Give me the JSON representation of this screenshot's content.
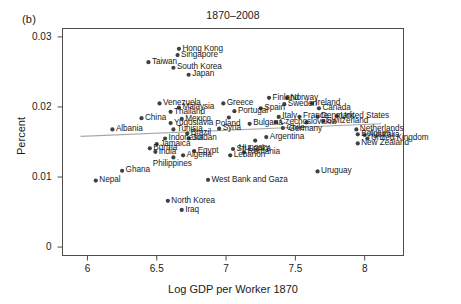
{
  "figure": {
    "panel_tag": "(b)",
    "title": "1870–2008"
  },
  "axes": {
    "xlabel": "Log GDP per Worker 1870",
    "ylabel": "Percent",
    "xticks": [
      "6",
      "6.5",
      "7",
      "7.5",
      "8"
    ],
    "yticks": [
      "0",
      "0.01",
      "0.02",
      "0.03"
    ]
  },
  "chart_data": {
    "type": "scatter",
    "title": "1870–2008",
    "xlabel": "Log GDP per Worker 1870",
    "ylabel": "Percent",
    "xlim": [
      5.82,
      8.28
    ],
    "ylim": [
      -0.0012,
      0.0312
    ],
    "xticks": [
      6,
      6.5,
      7,
      7.5,
      8
    ],
    "yticks": [
      0,
      0.01,
      0.02,
      0.03
    ],
    "grid": false,
    "legend": null,
    "marker_color": "#404040",
    "fit_line": {
      "label": "regression line",
      "color": "#a8a8a8",
      "x": [
        5.95,
        8.12
      ],
      "y": [
        0.0158,
        0.0176
      ]
    },
    "points": [
      {
        "label": "Hong Kong",
        "x": 6.66,
        "y": 0.0283,
        "label_pos": "right"
      },
      {
        "label": "Singapore",
        "x": 6.65,
        "y": 0.0274,
        "label_pos": "right"
      },
      {
        "label": "Taiwan",
        "x": 6.44,
        "y": 0.0264,
        "label_pos": "right"
      },
      {
        "label": "South Korea",
        "x": 6.62,
        "y": 0.0256,
        "label_pos": "right"
      },
      {
        "label": "Japan",
        "x": 6.73,
        "y": 0.0246,
        "label_pos": "right"
      },
      {
        "label": "Venezuela",
        "x": 6.52,
        "y": 0.0205,
        "label_pos": "right"
      },
      {
        "label": "Greece",
        "x": 6.98,
        "y": 0.0205,
        "label_pos": "right"
      },
      {
        "label": "Finland",
        "x": 7.31,
        "y": 0.0213,
        "label_pos": "right"
      },
      {
        "label": "Norway",
        "x": 7.44,
        "y": 0.0213,
        "label_pos": "right"
      },
      {
        "label": "Sweden",
        "x": 7.42,
        "y": 0.0204,
        "label_pos": "right"
      },
      {
        "label": "Ireland",
        "x": 7.62,
        "y": 0.0205,
        "label_pos": "right"
      },
      {
        "label": "Malaysia",
        "x": 6.66,
        "y": 0.0199,
        "label_pos": "right"
      },
      {
        "label": "Thailand",
        "x": 6.6,
        "y": 0.0193,
        "label_pos": "right"
      },
      {
        "label": "Portugal",
        "x": 7.06,
        "y": 0.0194,
        "label_pos": "right"
      },
      {
        "label": "Spain",
        "x": 7.25,
        "y": 0.0198,
        "label_pos": "right"
      },
      {
        "label": "Canada",
        "x": 7.67,
        "y": 0.0198,
        "label_pos": "right"
      },
      {
        "label": "China",
        "x": 6.39,
        "y": 0.0184,
        "label_pos": "right"
      },
      {
        "label": "Mexico",
        "x": 6.68,
        "y": 0.0183,
        "label_pos": "right"
      },
      {
        "label": "Poland",
        "x": 7.02,
        "y": 0.0185,
        "label_pos": "below"
      },
      {
        "label": "Italy",
        "x": 7.38,
        "y": 0.0186,
        "label_pos": "right"
      },
      {
        "label": "France",
        "x": 7.53,
        "y": 0.0186,
        "label_pos": "right"
      },
      {
        "label": "Denmark",
        "x": 7.66,
        "y": 0.0186,
        "label_pos": "right"
      },
      {
        "label": "United States",
        "x": 7.8,
        "y": 0.0187,
        "label_pos": "right"
      },
      {
        "label": "Yugoslavia",
        "x": 6.6,
        "y": 0.0177,
        "label_pos": "right"
      },
      {
        "label": "Bulgaria",
        "x": 7.17,
        "y": 0.0176,
        "label_pos": "right"
      },
      {
        "label": "Czechoslovakia",
        "x": 7.36,
        "y": 0.0178,
        "label_pos": "right"
      },
      {
        "label": "Germany",
        "x": 7.58,
        "y": 0.0178,
        "label_pos": "below"
      },
      {
        "label": "Switzerland",
        "x": 7.7,
        "y": 0.018,
        "label_pos": "right"
      },
      {
        "label": "Albania",
        "x": 6.18,
        "y": 0.0168,
        "label_pos": "right"
      },
      {
        "label": "Tunisia",
        "x": 6.62,
        "y": 0.0168,
        "label_pos": "right"
      },
      {
        "label": "Syria",
        "x": 6.95,
        "y": 0.0169,
        "label_pos": "right"
      },
      {
        "label": "Chile",
        "x": 7.41,
        "y": 0.017,
        "label_pos": "right"
      },
      {
        "label": "Netherlands",
        "x": 7.94,
        "y": 0.0168,
        "label_pos": "right"
      },
      {
        "label": "Brazil",
        "x": 6.72,
        "y": 0.0162,
        "label_pos": "right"
      },
      {
        "label": "Belgium",
        "x": 7.95,
        "y": 0.0161,
        "label_pos": "right"
      },
      {
        "label": "Australia",
        "x": 8.0,
        "y": 0.016,
        "label_pos": "right"
      },
      {
        "label": "United Kingdom",
        "x": 8.02,
        "y": 0.0155,
        "label_pos": "right"
      },
      {
        "label": "Argentina",
        "x": 7.29,
        "y": 0.0157,
        "label_pos": "right"
      },
      {
        "label": "Hungary",
        "x": 7.21,
        "y": 0.0152,
        "label_pos": "below"
      },
      {
        "label": "Indonesia",
        "x": 6.56,
        "y": 0.0155,
        "label_pos": "right"
      },
      {
        "label": "Jordan",
        "x": 6.73,
        "y": 0.0155,
        "label_pos": "right"
      },
      {
        "label": "New Zealand",
        "x": 7.95,
        "y": 0.0148,
        "label_pos": "right"
      },
      {
        "label": "Jamaica",
        "x": 6.5,
        "y": 0.0147,
        "label_pos": "right"
      },
      {
        "label": "Burma",
        "x": 6.45,
        "y": 0.0141,
        "label_pos": "right"
      },
      {
        "label": "India",
        "x": 6.49,
        "y": 0.0136,
        "label_pos": "right"
      },
      {
        "label": "Egypt",
        "x": 6.77,
        "y": 0.0137,
        "label_pos": "right"
      },
      {
        "label": "Sri Lanka",
        "x": 7.05,
        "y": 0.014,
        "label_pos": "right"
      },
      {
        "label": "Romania",
        "x": 7.13,
        "y": 0.0135,
        "label_pos": "right"
      },
      {
        "label": "Algeria",
        "x": 6.69,
        "y": 0.0131,
        "label_pos": "right"
      },
      {
        "label": "Lebanon",
        "x": 7.03,
        "y": 0.0131,
        "label_pos": "right"
      },
      {
        "label": "Philippines",
        "x": 6.62,
        "y": 0.0128,
        "label_pos": "below"
      },
      {
        "label": "Ghana",
        "x": 6.25,
        "y": 0.0109,
        "label_pos": "right"
      },
      {
        "label": "Uruguay",
        "x": 7.66,
        "y": 0.0108,
        "label_pos": "right"
      },
      {
        "label": "Nepal",
        "x": 6.06,
        "y": 0.0095,
        "label_pos": "right"
      },
      {
        "label": "West Bank and Gaza",
        "x": 6.87,
        "y": 0.0096,
        "label_pos": "right"
      },
      {
        "label": "North Korea",
        "x": 6.58,
        "y": 0.0066,
        "label_pos": "right"
      },
      {
        "label": "Iraq",
        "x": 6.68,
        "y": 0.0053,
        "label_pos": "right"
      }
    ]
  }
}
